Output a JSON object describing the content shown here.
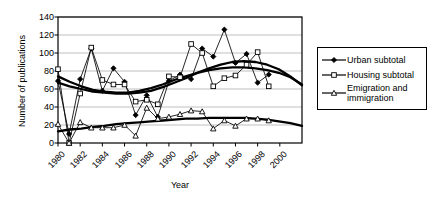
{
  "chart_data": {
    "type": "line",
    "title": "",
    "xlabel": "Year",
    "ylabel": "Number of publications",
    "xlim": [
      1980,
      2002
    ],
    "ylim": [
      0,
      140
    ],
    "ytick_values": [
      0,
      20,
      40,
      60,
      80,
      100,
      120,
      140
    ],
    "ytick_labels": [
      "0",
      "20",
      "40",
      "60",
      "80",
      "100",
      "120",
      "140"
    ],
    "xtick_values": [
      1980,
      1982,
      1984,
      1986,
      1988,
      1990,
      1992,
      1994,
      1996,
      1998,
      2000
    ],
    "xtick_labels": [
      "1980",
      "1982",
      "1984",
      "1986",
      "1988",
      "1990",
      "1992",
      "1994",
      "1996",
      "1998",
      "2000"
    ],
    "grid": "horizontal",
    "legend_position": "right-outside",
    "x": [
      1980,
      1981,
      1982,
      1983,
      1984,
      1985,
      1986,
      1987,
      1988,
      1989,
      1990,
      1991,
      1992,
      1993,
      1994,
      1995,
      1996,
      1997,
      1998,
      1999
    ],
    "series": [
      {
        "name": "Urban subtotal",
        "marker": "filled-diamond",
        "values": [
          69,
          10,
          71,
          105,
          58,
          83,
          68,
          31,
          53,
          29,
          69,
          76,
          71,
          105,
          96,
          126,
          89,
          99,
          67,
          76
        ],
        "trend": [
          67,
          63,
          60,
          57,
          56,
          55,
          55,
          56,
          58,
          62,
          67,
          72,
          78,
          83,
          87,
          90,
          91,
          90,
          87,
          82,
          74,
          64
        ]
      },
      {
        "name": "Housing subtotal",
        "marker": "open-square",
        "values": [
          82,
          0,
          55,
          106,
          70,
          65,
          65,
          46,
          48,
          43,
          74,
          73,
          110,
          100,
          63,
          72,
          75,
          87,
          101,
          63
        ],
        "trend": [
          74,
          68,
          63,
          59,
          57,
          56,
          56,
          58,
          61,
          65,
          70,
          74,
          78,
          81,
          83,
          84,
          84,
          83,
          81,
          78,
          73,
          65
        ]
      },
      {
        "name": "Emigration and immigration",
        "marker": "open-triangle",
        "values": [
          21,
          0,
          23,
          17,
          17,
          17,
          20,
          8,
          39,
          27,
          29,
          32,
          36,
          35,
          16,
          25,
          19,
          27,
          27,
          25
        ],
        "trend": [
          13,
          15,
          16,
          18,
          19,
          21,
          22,
          23,
          24,
          25,
          26,
          27,
          27,
          28,
          28,
          28,
          28,
          27,
          26,
          24,
          22,
          19
        ]
      }
    ]
  },
  "legend": {
    "items": [
      {
        "label": "Urban subtotal",
        "marker": "filled-diamond"
      },
      {
        "label": "Housing subtotal",
        "marker": "open-square"
      },
      {
        "label": "Emigration and",
        "label2": "immigration",
        "marker": "open-triangle"
      }
    ]
  },
  "colors": {
    "axis": "#000000",
    "grid": "#bfbfbf",
    "series": "#000000",
    "background": "#ffffff"
  }
}
